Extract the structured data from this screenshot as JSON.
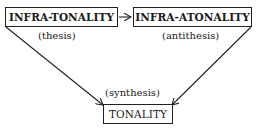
{
  "diagram": {
    "nodes": [
      {
        "id": "infra-tonality",
        "label": "INFRA-TONALITY",
        "caption": "(thesis)"
      },
      {
        "id": "infra-atonality",
        "label": "INFRA-ATONALITY",
        "caption": "(antithesis)"
      },
      {
        "id": "tonality",
        "label": "TONALITY",
        "caption": "(synthesis)"
      }
    ],
    "edges": [
      {
        "from": "infra-tonality",
        "to": "infra-atonality"
      },
      {
        "from": "infra-tonality",
        "to": "tonality"
      },
      {
        "from": "infra-atonality",
        "to": "tonality"
      }
    ]
  }
}
